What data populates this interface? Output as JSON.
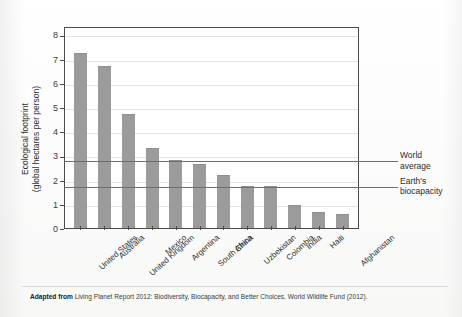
{
  "chart_data": {
    "type": "bar",
    "title": "",
    "xlabel": "",
    "ylabel": "Ecological footprint (global hectares per person)",
    "ylabel_line1": "Ecological footprint",
    "ylabel_line2": "(global hectares per person)",
    "ylim": [
      0,
      8.35
    ],
    "yticks": [
      0,
      1,
      2,
      3,
      4,
      5,
      6,
      7,
      8
    ],
    "ytick_labels": [
      "0",
      "1",
      "2",
      "3",
      "4",
      "5",
      "6",
      "7",
      "8"
    ],
    "grid": true,
    "legend": "none",
    "categories": [
      "United States",
      "Australia",
      "United Kingdom",
      "Mexico",
      "Argentina",
      "South Africa",
      "China",
      "Uzbekistan",
      "Colombia",
      "India",
      "Haiti",
      "Afghanistan"
    ],
    "values": [
      7.25,
      6.7,
      4.7,
      3.3,
      2.8,
      2.65,
      2.2,
      1.75,
      1.75,
      0.95,
      0.65,
      0.6
    ],
    "bar_color": "#9b9b9b",
    "reference_lines": [
      {
        "label_line1": "World",
        "label_line2": "average",
        "value": 2.8,
        "color": "#6e6e6e"
      },
      {
        "label_line1": "Earth's",
        "label_line2": "biocapacity",
        "value": 1.75,
        "color": "#6e6e6e"
      }
    ]
  },
  "caption": {
    "lead": "Adapted from",
    "text": " Living Planet Report 2012: Biodiversity, Biocapacity, and Better Choices, World Wildlife Fund (2012)."
  }
}
